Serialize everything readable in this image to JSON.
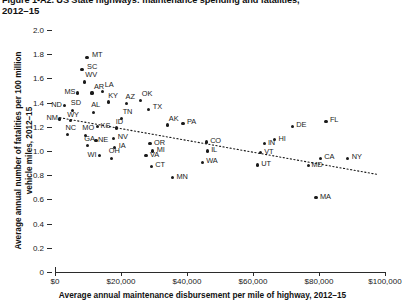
{
  "figure": {
    "title_line1": "Figure 1-A2. US State highways: maintenance spending and fatalities,",
    "title_line2": "2012–15"
  },
  "chart_data": {
    "type": "scatter",
    "title": "Figure 1-A2. US State highways: maintenance spending and fatalities, 2012–15",
    "xlabel": "Average annual maintenance disbursement per mile of highway, 2012–15",
    "ylabel": "Average annual number of fatalities per 100 million vehicle miles, 2012–15",
    "xlim": [
      0,
      100000
    ],
    "ylim": [
      0,
      2.0
    ],
    "grid": false,
    "legend": null,
    "xticks": [
      0,
      20000,
      40000,
      60000,
      80000,
      100000
    ],
    "xticklabels": [
      "$0",
      "$20,000",
      "$40,000",
      "$60,000",
      "$80,000",
      "$100,000"
    ],
    "yticks": [
      0,
      0.2,
      0.4,
      0.6,
      0.8,
      1.0,
      1.2,
      1.4,
      1.6,
      1.8,
      2.0
    ],
    "yticklabels": [
      "0",
      "0.2",
      "0.4",
      "0.6",
      "0.8",
      "1.0",
      "1.2",
      "1.4",
      "1.6",
      "1.8",
      "2.0"
    ],
    "trendline": {
      "style": "dotted",
      "x": [
        1500,
        98000
      ],
      "y": [
        1.275,
        0.805
      ]
    },
    "points": [
      {
        "label": "MT",
        "x": 9700,
        "y": 1.775,
        "lx": 5,
        "ly": -4
      },
      {
        "label": "SC",
        "x": 8200,
        "y": 1.675,
        "lx": 5,
        "ly": -4
      },
      {
        "label": "WV",
        "x": 8900,
        "y": 1.57,
        "lx": 1,
        "ly": -9
      },
      {
        "label": "MS",
        "x": 6800,
        "y": 1.48,
        "lx": -13,
        "ly": -3
      },
      {
        "label": "AR",
        "x": 11200,
        "y": 1.48,
        "lx": 2,
        "ly": -8
      },
      {
        "label": "LA",
        "x": 14500,
        "y": 1.495,
        "lx": 2,
        "ly": -8
      },
      {
        "label": "ND",
        "x": 2800,
        "y": 1.375,
        "lx": -13,
        "ly": -3
      },
      {
        "label": "SD",
        "x": 5400,
        "y": 1.335,
        "lx": -2,
        "ly": -9
      },
      {
        "label": "AL",
        "x": 11600,
        "y": 1.32,
        "lx": -2,
        "ly": -9
      },
      {
        "label": "KY",
        "x": 16100,
        "y": 1.405,
        "lx": 0,
        "ly": -8
      },
      {
        "label": "AZ",
        "x": 21700,
        "y": 1.395,
        "lx": -1,
        "ly": -8
      },
      {
        "label": "OK",
        "x": 26000,
        "y": 1.42,
        "lx": 1,
        "ly": -8
      },
      {
        "label": "TX",
        "x": 28400,
        "y": 1.345,
        "lx": 4,
        "ly": -4
      },
      {
        "label": "NM",
        "x": 1400,
        "y": 1.265,
        "lx": -13,
        "ly": -3
      },
      {
        "label": "WY",
        "x": 4600,
        "y": 1.25,
        "lx": -3,
        "ly": -8
      },
      {
        "label": "TN",
        "x": 20200,
        "y": 1.27,
        "lx": 1,
        "ly": -8
      },
      {
        "label": "KS",
        "x": 12900,
        "y": 1.2,
        "lx": 3,
        "ly": -3
      },
      {
        "label": "ID",
        "x": 18700,
        "y": 1.19,
        "lx": -1,
        "ly": -8
      },
      {
        "label": "AK",
        "x": 34200,
        "y": 1.215,
        "lx": 1,
        "ly": -8
      },
      {
        "label": "NC",
        "x": 3800,
        "y": 1.135,
        "lx": -2,
        "ly": -9
      },
      {
        "label": "MO",
        "x": 9200,
        "y": 1.13,
        "lx": -3,
        "ly": -9
      },
      {
        "label": "NE",
        "x": 12400,
        "y": 1.085,
        "lx": 2,
        "ly": -3
      },
      {
        "label": "NV",
        "x": 17800,
        "y": 1.105,
        "lx": 4,
        "ly": -3
      },
      {
        "label": "GA",
        "x": 9800,
        "y": 1.045,
        "lx": -3,
        "ly": -9
      },
      {
        "label": "IA",
        "x": 18100,
        "y": 1.03,
        "lx": 4,
        "ly": -3
      },
      {
        "label": "PA",
        "x": 38800,
        "y": 1.23,
        "lx": 4,
        "ly": -3
      },
      {
        "label": "OR",
        "x": 28800,
        "y": 1.06,
        "lx": 4,
        "ly": -3
      },
      {
        "label": "MI",
        "x": 29600,
        "y": 1.0,
        "lx": 4,
        "ly": -3
      },
      {
        "label": "WI",
        "x": 13500,
        "y": 0.96,
        "lx": -12,
        "ly": -3
      },
      {
        "label": "OH",
        "x": 17200,
        "y": 0.94,
        "lx": -3,
        "ly": -9
      },
      {
        "label": "VA",
        "x": 27600,
        "y": 0.96,
        "lx": 4,
        "ly": -3
      },
      {
        "label": "CT",
        "x": 29200,
        "y": 0.875,
        "lx": 4,
        "ly": -3
      },
      {
        "label": "CO",
        "x": 45800,
        "y": 1.075,
        "lx": 4,
        "ly": -3
      },
      {
        "label": "IL",
        "x": 46100,
        "y": 1.0,
        "lx": 4,
        "ly": -3
      },
      {
        "label": "MN",
        "x": 35600,
        "y": 0.78,
        "lx": 4,
        "ly": -3
      },
      {
        "label": "WA",
        "x": 44600,
        "y": 0.905,
        "lx": 4,
        "ly": -3
      },
      {
        "label": "IN",
        "x": 63600,
        "y": 1.06,
        "lx": 3,
        "ly": -3
      },
      {
        "label": "HI",
        "x": 66500,
        "y": 1.095,
        "lx": 4,
        "ly": -3
      },
      {
        "label": "VT",
        "x": 62200,
        "y": 0.985,
        "lx": 4,
        "ly": -3
      },
      {
        "label": "UT",
        "x": 61300,
        "y": 0.885,
        "lx": 4,
        "ly": -3
      },
      {
        "label": "MD",
        "x": 76800,
        "y": 0.88,
        "lx": 3,
        "ly": -3
      },
      {
        "label": "CA",
        "x": 80400,
        "y": 0.94,
        "lx": 4,
        "ly": -3
      },
      {
        "label": "NY",
        "x": 88700,
        "y": 0.94,
        "lx": 4,
        "ly": -3
      },
      {
        "label": "DE",
        "x": 71900,
        "y": 1.205,
        "lx": 4,
        "ly": -3
      },
      {
        "label": "FL",
        "x": 82100,
        "y": 1.245,
        "lx": 4,
        "ly": -3
      },
      {
        "label": "MA",
        "x": 79100,
        "y": 0.615,
        "lx": 4,
        "ly": -3
      }
    ]
  }
}
